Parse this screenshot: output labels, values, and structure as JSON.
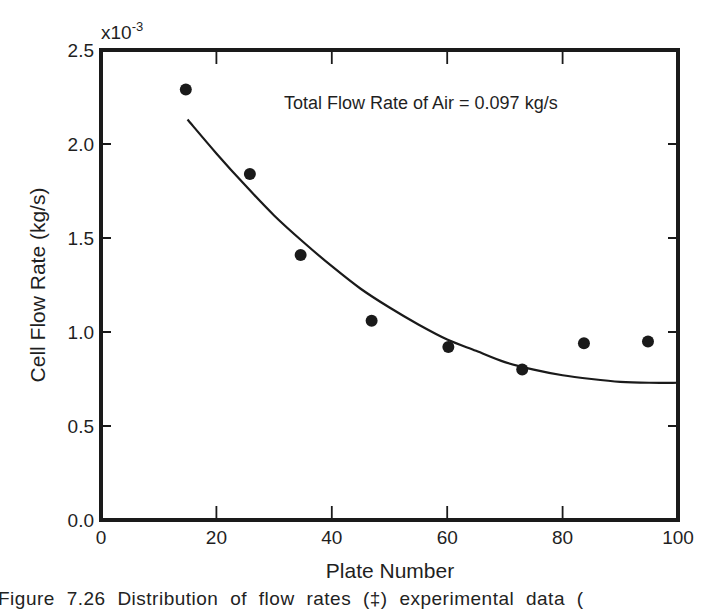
{
  "chart_data": {
    "type": "scatter",
    "title": "",
    "annotation": "Total Flow Rate of Air = 0.097 kg/s",
    "xlabel": "Plate Number",
    "ylabel": "Cell Flow Rate (kg/s)",
    "y_multiplier_label": "x10",
    "y_multiplier_exponent": "-3",
    "xlim": [
      0,
      100
    ],
    "ylim": [
      0.0,
      2.5
    ],
    "x_ticks": [
      0,
      20,
      40,
      60,
      80,
      100
    ],
    "x_tick_labels": [
      "0",
      "20",
      "40",
      "60",
      "80",
      "100"
    ],
    "y_ticks": [
      0.0,
      0.5,
      1.0,
      1.5,
      2.0,
      2.5
    ],
    "y_tick_labels": [
      "0.0",
      "0.5",
      "1.0",
      "1.5",
      "2.0",
      "2.5"
    ],
    "grid": false,
    "legend": null,
    "series": [
      {
        "name": "Experimental data",
        "kind": "scatter",
        "marker": "filled-circle",
        "x": [
          14.7,
          25.8,
          34.6,
          46.9,
          60.2,
          73.0,
          83.7,
          94.8
        ],
        "y": [
          2.29,
          1.84,
          1.41,
          1.06,
          0.92,
          0.8,
          0.94,
          0.95
        ]
      },
      {
        "name": "Calculated distribution",
        "kind": "line",
        "x": [
          15,
          20,
          25,
          30,
          35,
          40,
          45,
          50,
          55,
          60,
          65,
          70,
          75,
          80,
          85,
          90,
          95,
          100
        ],
        "y": [
          2.13,
          1.95,
          1.78,
          1.62,
          1.48,
          1.35,
          1.23,
          1.13,
          1.04,
          0.96,
          0.9,
          0.84,
          0.8,
          0.77,
          0.75,
          0.735,
          0.73,
          0.73
        ]
      }
    ]
  },
  "figure": {
    "caption": "Figure 7.26  Distribution of flow rates (‡) experimental data ("
  },
  "colors": {
    "ink": "#1a1a1a",
    "background": "#ffffff"
  }
}
